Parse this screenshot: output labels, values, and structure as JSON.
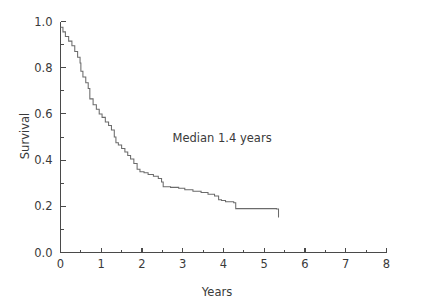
{
  "chart_data": {
    "type": "line",
    "subtype": "kaplan-meier-step",
    "title": "",
    "xlabel": "Years",
    "ylabel": "Survival",
    "xlim": [
      0,
      8
    ],
    "ylim": [
      0.0,
      1.0
    ],
    "grid": false,
    "legend": null,
    "legend_position": "none",
    "line_color": "#6b6b6b",
    "axis_color": "#4a4a4a",
    "text_color": "#3a3a3a",
    "background_color": "#ffffff",
    "xticks": [
      0,
      1,
      2,
      3,
      4,
      5,
      6,
      7,
      8
    ],
    "xtick_labels": [
      "0",
      "1",
      "2",
      "3",
      "4",
      "5",
      "6",
      "7",
      "8"
    ],
    "xticks_minor": [
      0.5,
      1.5,
      2.5,
      3.5,
      4.5,
      5.5,
      6.5,
      7.5
    ],
    "yticks": [
      0.0,
      0.2,
      0.4,
      0.6,
      0.8,
      1.0
    ],
    "ytick_labels": [
      "0.0",
      "0.2",
      "0.4",
      "0.6",
      "0.8",
      "1.0"
    ],
    "yticks_minor": [
      0.1,
      0.3,
      0.5,
      0.7,
      0.9
    ],
    "annotations": [
      {
        "text": "Median 1.4 years",
        "x": 2.75,
        "y": 0.48
      }
    ],
    "series": [
      {
        "name": "Survival",
        "x": [
          0.0,
          0.06,
          0.12,
          0.2,
          0.28,
          0.35,
          0.42,
          0.48,
          0.5,
          0.55,
          0.62,
          0.68,
          0.72,
          0.8,
          0.88,
          0.95,
          1.02,
          1.1,
          1.18,
          1.25,
          1.32,
          1.36,
          1.42,
          1.5,
          1.58,
          1.65,
          1.72,
          1.8,
          1.88,
          1.95,
          2.05,
          2.15,
          2.28,
          2.4,
          2.48,
          2.52,
          2.7,
          2.9,
          3.05,
          3.25,
          3.45,
          3.62,
          3.78,
          3.88,
          3.95,
          4.05,
          4.25,
          4.3,
          5.3,
          5.35
        ],
        "y": [
          0.975,
          0.955,
          0.935,
          0.915,
          0.895,
          0.87,
          0.845,
          0.82,
          0.785,
          0.76,
          0.735,
          0.71,
          0.665,
          0.64,
          0.62,
          0.6,
          0.585,
          0.565,
          0.55,
          0.53,
          0.5,
          0.475,
          0.465,
          0.45,
          0.435,
          0.42,
          0.405,
          0.385,
          0.36,
          0.35,
          0.345,
          0.338,
          0.33,
          0.32,
          0.305,
          0.285,
          0.282,
          0.278,
          0.272,
          0.265,
          0.26,
          0.252,
          0.245,
          0.228,
          0.225,
          0.22,
          0.215,
          0.19,
          0.188,
          0.152
        ]
      }
    ]
  },
  "figure": {
    "xlabel": "Years",
    "ylabel": "Survival",
    "annotation": "Median 1.4 years"
  }
}
